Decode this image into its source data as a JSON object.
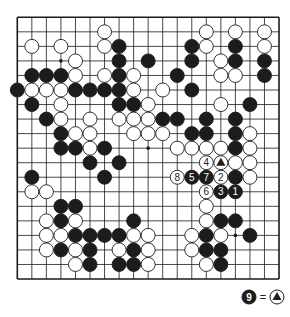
{
  "board": {
    "size": 19,
    "origin": [
      17.3,
      17.3
    ],
    "spacing": 14.54,
    "stone_radius": 7.0,
    "colors": {
      "line": "#1a1a1a",
      "black": "#1c1c1c",
      "white": "#ffffff",
      "background": "#ffffff"
    },
    "hoshi": [
      [
        3,
        3
      ],
      [
        9,
        3
      ],
      [
        15,
        3
      ],
      [
        3,
        9
      ],
      [
        9,
        9
      ],
      [
        15,
        9
      ],
      [
        3,
        15
      ],
      [
        9,
        15
      ],
      [
        15,
        15
      ]
    ],
    "stones": [
      {
        "c": 6,
        "r": 1,
        "color": "W"
      },
      {
        "c": 13,
        "r": 1,
        "color": "W"
      },
      {
        "c": 15,
        "r": 1,
        "color": "W"
      },
      {
        "c": 17,
        "r": 1,
        "color": "W"
      },
      {
        "c": 1,
        "r": 2,
        "color": "W"
      },
      {
        "c": 3,
        "r": 2,
        "color": "W"
      },
      {
        "c": 6,
        "r": 2,
        "color": "W"
      },
      {
        "c": 7,
        "r": 2,
        "color": "B"
      },
      {
        "c": 12,
        "r": 2,
        "color": "B"
      },
      {
        "c": 13,
        "r": 2,
        "color": "W"
      },
      {
        "c": 15,
        "r": 2,
        "color": "B"
      },
      {
        "c": 17,
        "r": 2,
        "color": "W"
      },
      {
        "c": 4,
        "r": 3,
        "color": "W"
      },
      {
        "c": 7,
        "r": 3,
        "color": "B"
      },
      {
        "c": 9,
        "r": 3,
        "color": "B"
      },
      {
        "c": 12,
        "r": 3,
        "color": "B"
      },
      {
        "c": 14,
        "r": 3,
        "color": "W"
      },
      {
        "c": 15,
        "r": 3,
        "color": "B"
      },
      {
        "c": 17,
        "r": 3,
        "color": "B"
      },
      {
        "c": 1,
        "r": 4,
        "color": "B"
      },
      {
        "c": 2,
        "r": 4,
        "color": "B"
      },
      {
        "c": 3,
        "r": 4,
        "color": "B"
      },
      {
        "c": 4,
        "r": 4,
        "color": "W"
      },
      {
        "c": 6,
        "r": 4,
        "color": "W"
      },
      {
        "c": 7,
        "r": 4,
        "color": "B"
      },
      {
        "c": 8,
        "r": 4,
        "color": "W"
      },
      {
        "c": 11,
        "r": 4,
        "color": "B"
      },
      {
        "c": 14,
        "r": 4,
        "color": "W"
      },
      {
        "c": 15,
        "r": 4,
        "color": "W"
      },
      {
        "c": 17,
        "r": 4,
        "color": "B"
      },
      {
        "c": 0,
        "r": 5,
        "color": "B"
      },
      {
        "c": 1,
        "r": 5,
        "color": "W"
      },
      {
        "c": 2,
        "r": 5,
        "color": "W"
      },
      {
        "c": 3,
        "r": 5,
        "color": "W"
      },
      {
        "c": 4,
        "r": 5,
        "color": "B"
      },
      {
        "c": 5,
        "r": 5,
        "color": "B"
      },
      {
        "c": 6,
        "r": 5,
        "color": "B"
      },
      {
        "c": 7,
        "r": 5,
        "color": "B"
      },
      {
        "c": 8,
        "r": 5,
        "color": "W"
      },
      {
        "c": 10,
        "r": 5,
        "color": "W"
      },
      {
        "c": 12,
        "r": 5,
        "color": "B"
      },
      {
        "c": 1,
        "r": 6,
        "color": "B"
      },
      {
        "c": 3,
        "r": 6,
        "color": "W"
      },
      {
        "c": 7,
        "r": 6,
        "color": "B"
      },
      {
        "c": 8,
        "r": 6,
        "color": "B"
      },
      {
        "c": 9,
        "r": 6,
        "color": "W"
      },
      {
        "c": 14,
        "r": 6,
        "color": "W"
      },
      {
        "c": 16,
        "r": 6,
        "color": "B"
      },
      {
        "c": 2,
        "r": 7,
        "color": "B"
      },
      {
        "c": 3,
        "r": 7,
        "color": "W"
      },
      {
        "c": 5,
        "r": 7,
        "color": "W"
      },
      {
        "c": 7,
        "r": 7,
        "color": "W"
      },
      {
        "c": 8,
        "r": 7,
        "color": "W"
      },
      {
        "c": 9,
        "r": 7,
        "color": "W"
      },
      {
        "c": 10,
        "r": 7,
        "color": "B"
      },
      {
        "c": 11,
        "r": 7,
        "color": "B"
      },
      {
        "c": 13,
        "r": 7,
        "color": "B"
      },
      {
        "c": 15,
        "r": 7,
        "color": "B"
      },
      {
        "c": 3,
        "r": 8,
        "color": "B"
      },
      {
        "c": 4,
        "r": 8,
        "color": "W"
      },
      {
        "c": 5,
        "r": 8,
        "color": "W"
      },
      {
        "c": 8,
        "r": 8,
        "color": "W"
      },
      {
        "c": 9,
        "r": 8,
        "color": "W"
      },
      {
        "c": 10,
        "r": 8,
        "color": "W"
      },
      {
        "c": 12,
        "r": 8,
        "color": "B"
      },
      {
        "c": 13,
        "r": 8,
        "color": "B"
      },
      {
        "c": 15,
        "r": 8,
        "color": "B"
      },
      {
        "c": 16,
        "r": 8,
        "color": "W"
      },
      {
        "c": 3,
        "r": 9,
        "color": "B"
      },
      {
        "c": 4,
        "r": 9,
        "color": "B"
      },
      {
        "c": 5,
        "r": 9,
        "color": "W"
      },
      {
        "c": 6,
        "r": 9,
        "color": "B"
      },
      {
        "c": 11,
        "r": 9,
        "color": "W"
      },
      {
        "c": 12,
        "r": 9,
        "color": "W"
      },
      {
        "c": 13,
        "r": 9,
        "color": "W"
      },
      {
        "c": 14,
        "r": 9,
        "color": "W"
      },
      {
        "c": 15,
        "r": 9,
        "color": "B"
      },
      {
        "c": 16,
        "r": 9,
        "color": "W"
      },
      {
        "c": 5,
        "r": 10,
        "color": "B"
      },
      {
        "c": 7,
        "r": 10,
        "color": "B"
      },
      {
        "c": 13,
        "r": 10,
        "color": "W",
        "label": "4"
      },
      {
        "c": 14,
        "r": 10,
        "color": "W",
        "mark": "triangle"
      },
      {
        "c": 15,
        "r": 10,
        "color": "W"
      },
      {
        "c": 16,
        "r": 10,
        "color": "W"
      },
      {
        "c": 1,
        "r": 11,
        "color": "B"
      },
      {
        "c": 6,
        "r": 11,
        "color": "B"
      },
      {
        "c": 11,
        "r": 11,
        "color": "W",
        "label": "8"
      },
      {
        "c": 12,
        "r": 11,
        "color": "B",
        "label": "5"
      },
      {
        "c": 13,
        "r": 11,
        "color": "B",
        "label": "7"
      },
      {
        "c": 14,
        "r": 11,
        "color": "W",
        "label": "2"
      },
      {
        "c": 15,
        "r": 11,
        "color": "B"
      },
      {
        "c": 16,
        "r": 11,
        "color": "W"
      },
      {
        "c": 1,
        "r": 12,
        "color": "W"
      },
      {
        "c": 2,
        "r": 12,
        "color": "W"
      },
      {
        "c": 13,
        "r": 12,
        "color": "W",
        "label": "6"
      },
      {
        "c": 14,
        "r": 12,
        "color": "B",
        "label": "3"
      },
      {
        "c": 15,
        "r": 12,
        "color": "B",
        "label": "1"
      },
      {
        "c": 3,
        "r": 13,
        "color": "B"
      },
      {
        "c": 4,
        "r": 13,
        "color": "B"
      },
      {
        "c": 13,
        "r": 13,
        "color": "W"
      },
      {
        "c": 2,
        "r": 14,
        "color": "W"
      },
      {
        "c": 3,
        "r": 14,
        "color": "B"
      },
      {
        "c": 4,
        "r": 14,
        "color": "W"
      },
      {
        "c": 8,
        "r": 14,
        "color": "B"
      },
      {
        "c": 13,
        "r": 14,
        "color": "W"
      },
      {
        "c": 14,
        "r": 14,
        "color": "B"
      },
      {
        "c": 15,
        "r": 14,
        "color": "B"
      },
      {
        "c": 2,
        "r": 15,
        "color": "W"
      },
      {
        "c": 3,
        "r": 15,
        "color": "W"
      },
      {
        "c": 4,
        "r": 15,
        "color": "B"
      },
      {
        "c": 5,
        "r": 15,
        "color": "B"
      },
      {
        "c": 6,
        "r": 15,
        "color": "B"
      },
      {
        "c": 7,
        "r": 15,
        "color": "B"
      },
      {
        "c": 8,
        "r": 15,
        "color": "W"
      },
      {
        "c": 9,
        "r": 15,
        "color": "W"
      },
      {
        "c": 12,
        "r": 15,
        "color": "W"
      },
      {
        "c": 13,
        "r": 15,
        "color": "B"
      },
      {
        "c": 14,
        "r": 15,
        "color": "W"
      },
      {
        "c": 16,
        "r": 15,
        "color": "B"
      },
      {
        "c": 2,
        "r": 16,
        "color": "W"
      },
      {
        "c": 3,
        "r": 16,
        "color": "B"
      },
      {
        "c": 4,
        "r": 16,
        "color": "W"
      },
      {
        "c": 5,
        "r": 16,
        "color": "B"
      },
      {
        "c": 7,
        "r": 16,
        "color": "W"
      },
      {
        "c": 8,
        "r": 16,
        "color": "B"
      },
      {
        "c": 9,
        "r": 16,
        "color": "W"
      },
      {
        "c": 12,
        "r": 16,
        "color": "W"
      },
      {
        "c": 13,
        "r": 16,
        "color": "B"
      },
      {
        "c": 14,
        "r": 16,
        "color": "B"
      },
      {
        "c": 4,
        "r": 17,
        "color": "W"
      },
      {
        "c": 5,
        "r": 17,
        "color": "B"
      },
      {
        "c": 7,
        "r": 17,
        "color": "B"
      },
      {
        "c": 8,
        "r": 17,
        "color": "B"
      },
      {
        "c": 9,
        "r": 17,
        "color": "W"
      },
      {
        "c": 13,
        "r": 17,
        "color": "W"
      },
      {
        "c": 14,
        "r": 17,
        "color": "B"
      }
    ]
  },
  "legend": {
    "stone_label": "9",
    "stone_color": "B",
    "equals": "=",
    "target_mark": "triangle"
  }
}
